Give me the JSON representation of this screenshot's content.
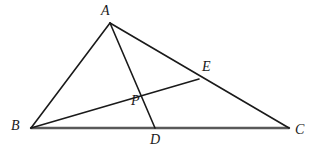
{
  "figure": {
    "type": "geometry-diagram",
    "background_color": "#ffffff",
    "stroke_color": "#1a1a1a",
    "base_stroke_color": "#595959",
    "label_color": "#1a1a1a",
    "canvas": {
      "width": 318,
      "height": 154
    }
  },
  "points": {
    "A": {
      "label": "A",
      "x": 110,
      "y": 23,
      "label_x": 101,
      "label_y": 4
    },
    "B": {
      "label": "B",
      "x": 31,
      "y": 128,
      "label_x": 11,
      "label_y": 119
    },
    "C": {
      "label": "C",
      "x": 289,
      "y": 128,
      "label_x": 295,
      "label_y": 123
    },
    "D": {
      "label": "D",
      "x": 155,
      "y": 128,
      "label_x": 150,
      "label_y": 133
    },
    "E": {
      "label": "E",
      "x": 199,
      "y": 79,
      "label_x": 202,
      "label_y": 60
    },
    "P": {
      "label": "P",
      "x": 143,
      "y": 91,
      "label_x": 131,
      "label_y": 94
    }
  },
  "segments": [
    {
      "name": "side-AB",
      "from": "A",
      "to": "B",
      "width": 1.6,
      "color": "#1a1a1a"
    },
    {
      "name": "side-AC",
      "from": "A",
      "to": "C",
      "width": 1.6,
      "color": "#1a1a1a"
    },
    {
      "name": "side-BC",
      "from": "B",
      "to": "C",
      "width": 2.4,
      "color": "#595959"
    },
    {
      "name": "cevian-AD",
      "from": "A",
      "to": "D",
      "width": 1.6,
      "color": "#1a1a1a"
    },
    {
      "name": "cevian-BE",
      "from": "B",
      "to": "E",
      "width": 1.6,
      "color": "#1a1a1a"
    }
  ]
}
